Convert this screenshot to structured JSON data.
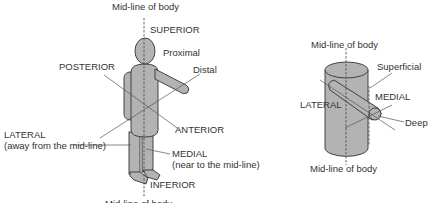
{
  "figure_left": {
    "labels": {
      "midline_top": "Mid-line of body",
      "superior": "SUPERIOR",
      "proximal": "Proximal",
      "distal": "Distal",
      "posterior": "POSTERIOR",
      "anterior": "ANTERIOR",
      "lateral": "LATERAL",
      "lateral_note": "(away from the mid-line)",
      "medial": "MEDIAL",
      "medial_note": "(near to the mid-line)",
      "inferior": "INFERIOR",
      "midline_bottom": "Mid-line of body"
    }
  },
  "figure_right": {
    "labels": {
      "midline_top": "Mid-line of body",
      "superficial": "Superficial",
      "lateral": "LATERAL",
      "medial": "MEDIAL",
      "deep": "Deep",
      "midline_bottom": "Mid-line of body"
    }
  },
  "colors": {
    "body": "#b3b3b3",
    "outline": "#333333",
    "text": "#333333"
  }
}
